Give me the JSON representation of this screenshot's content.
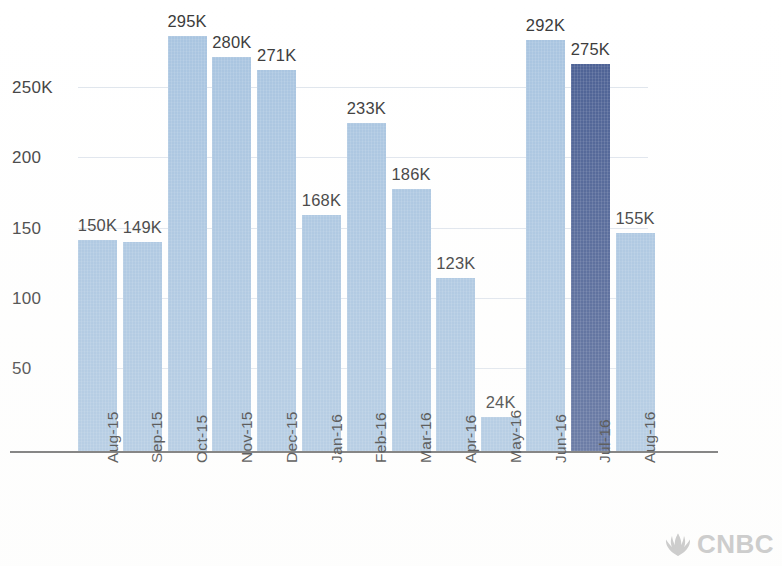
{
  "chart_data": {
    "type": "bar",
    "title": "",
    "subtitle": "",
    "xlabel": "",
    "ylabel": "",
    "categories": [
      "Aug-15",
      "Sep-15",
      "Oct-15",
      "Nov-15",
      "Dec-15",
      "Jan-16",
      "Feb-16",
      "Mar-16",
      "Apr-16",
      "May-16",
      "Jun-16",
      "Jul-16",
      "Aug-16"
    ],
    "values": [
      150,
      149,
      295,
      280,
      271,
      168,
      233,
      186,
      123,
      24,
      292,
      275,
      155
    ],
    "value_labels": [
      "150K",
      "149K",
      "295K",
      "280K",
      "271K",
      "168K",
      "233K",
      "186K",
      "123K",
      "24K",
      "292K",
      "275K",
      "155K"
    ],
    "ylim": [
      0,
      310
    ],
    "yticks": [
      50,
      100,
      150,
      200,
      250
    ],
    "ytick_labels": [
      "50",
      "100",
      "150",
      "200",
      "250K"
    ],
    "grid": true,
    "legend": "none",
    "highlight_index": 11,
    "colors": {
      "bar": "#a8c4e0",
      "bar_highlight": "#4a5f93",
      "axis": "#6a6a6a",
      "text": "#3a3a3a",
      "grid": "#b6c6d8",
      "background": "#ffffff"
    }
  },
  "branding": {
    "logo_text": "CNBC",
    "logo_mark_name": "peacock-icon",
    "logo_color": "#c9c9c9"
  }
}
